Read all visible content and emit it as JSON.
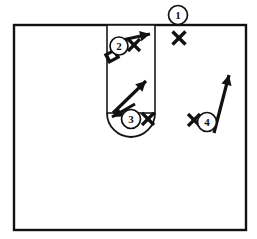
{
  "diagram": {
    "title": "Basketball Half-Court Play Diagram",
    "colors": {
      "line": "#111111",
      "background": "#ffffff",
      "lane_fill": "#ffffff"
    },
    "court": {
      "name": "half-court-boundary",
      "x": 14,
      "y": 25,
      "width": 232,
      "height": 205,
      "stroke_width": 2.4
    },
    "lane": {
      "name": "free-throw-lane",
      "x": 107,
      "y": 25,
      "width": 48,
      "height": 88,
      "stroke_width": 1.6
    },
    "free_throw_arc": {
      "name": "free-throw-semicircle",
      "center_x": 131,
      "center_y": 113,
      "radius": 24,
      "stroke_width": 1.8,
      "direction": "downward"
    },
    "players": [
      {
        "id": "player-1",
        "label": "1",
        "cx": 178,
        "cy": 15,
        "r": 9.5,
        "font_size": 11,
        "position_note": "top of key, on the boundary line"
      },
      {
        "id": "player-2",
        "label": "2",
        "cx": 119,
        "cy": 46,
        "r": 9,
        "font_size": 11,
        "position_note": "high post, left side of lane"
      },
      {
        "id": "player-3",
        "label": "3",
        "cx": 131,
        "cy": 119,
        "r": 9.5,
        "font_size": 11,
        "position_note": "free-throw line, center of lane"
      },
      {
        "id": "player-4",
        "label": "4",
        "cx": 207,
        "cy": 122,
        "r": 9.5,
        "font_size": 11,
        "position_note": "right wing"
      }
    ],
    "defenders": [
      {
        "id": "defender-x-1",
        "label": "X",
        "cx": 179,
        "cy": 38,
        "size": 13,
        "stroke_width": 3.4,
        "guards": "player-1"
      },
      {
        "id": "defender-x-2",
        "label": "X",
        "cx": 134,
        "cy": 45,
        "size": 12,
        "stroke_width": 3.2,
        "guards": "player-2"
      },
      {
        "id": "defender-x-3",
        "label": "X",
        "cx": 148,
        "cy": 119,
        "size": 12,
        "stroke_width": 3.2,
        "guards": "player-3"
      },
      {
        "id": "defender-x-4",
        "label": "X",
        "cx": 194,
        "cy": 120,
        "size": 12,
        "stroke_width": 3.2,
        "guards": "player-4"
      }
    ],
    "arrows": [
      {
        "id": "arrow-player-2-cut",
        "from_x": 113,
        "from_y": 42,
        "to_x": 150,
        "to_y": 34,
        "stroke_width": 3.2,
        "note": "player 2 moves right across the lane"
      },
      {
        "id": "arrow-player-3-cut",
        "from_x": 113,
        "from_y": 113,
        "to_x": 146,
        "to_y": 81,
        "stroke_width": 3.2,
        "note": "player 3 cuts up and to the right"
      },
      {
        "id": "arrow-player-3-back",
        "from_x": 135,
        "from_y": 104,
        "to_x": 112,
        "to_y": 117,
        "stroke_width": 3.0,
        "note": "secondary arrowhead back toward lower left"
      },
      {
        "id": "arrow-player-4-cut",
        "from_x": 214,
        "from_y": 133,
        "to_x": 229,
        "to_y": 75,
        "stroke_width": 3.2,
        "note": "player 4 cuts up the right side"
      }
    ],
    "block_mark": {
      "id": "screen-block-mark",
      "cx": 112,
      "cy": 56,
      "width": 11,
      "height": 9,
      "rotation": -28,
      "note": "small tilted block/screen symbol below player 2"
    }
  }
}
